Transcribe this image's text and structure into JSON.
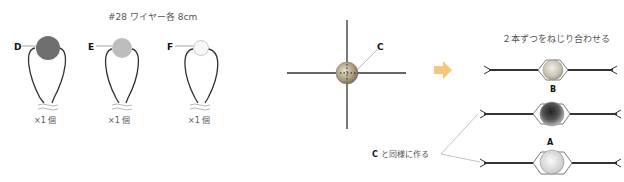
{
  "left_panel": {
    "title": "#28 ワイヤー各 8cm",
    "beads": [
      {
        "label": "D",
        "count": "×1 個",
        "color": "#6e6e6e"
      },
      {
        "label": "E",
        "count": "×1 個",
        "color": "#bdbdbd"
      },
      {
        "label": "F",
        "count": "×1 個",
        "color": "#f7f7f7"
      }
    ]
  },
  "middle_panel": {
    "label": "C"
  },
  "arrow": {
    "icon": "arrow-right-icon",
    "color": "#f5c77e"
  },
  "right_panel": {
    "title": "２本ずつをねじり合わせる",
    "labels": {
      "b": "B",
      "a": "A"
    },
    "note_label": "C",
    "note_text": "と同様に作る"
  }
}
